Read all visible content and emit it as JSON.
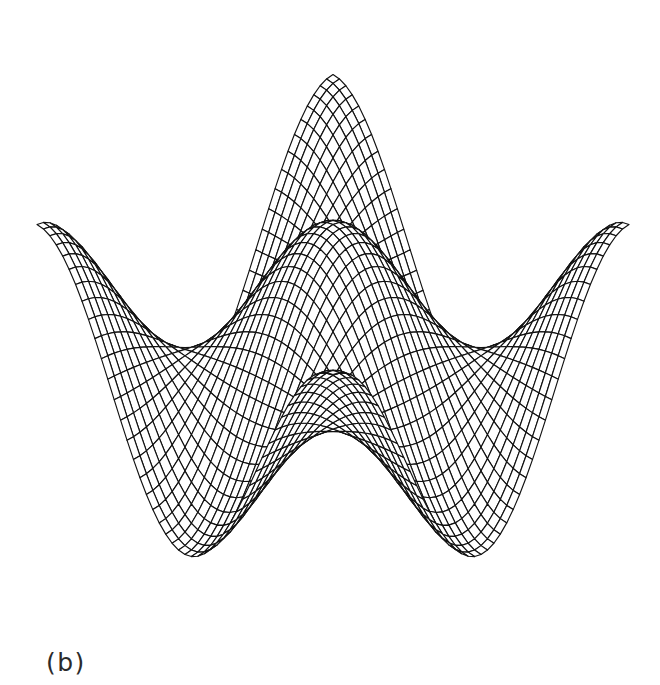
{
  "figure": {
    "caption": "(b)",
    "background_color": "#ffffff",
    "ink_color": "#111111",
    "width": 660,
    "height": 685
  },
  "chart_data": {
    "type": "surface",
    "render_style": "wireframe-mesh-hidden-line",
    "title": "",
    "subtitle": "",
    "xlabel": "",
    "ylabel": "",
    "zlabel": "",
    "grid": false,
    "axes_visible": false,
    "legend": null,
    "legend_position": "none",
    "annotations": [
      {
        "text": "(b)",
        "x": 46,
        "y": 648,
        "role": "figure-part-label"
      }
    ],
    "function": "z = cos(pi*x) * cos(pi*y)",
    "domain": {
      "x": [
        -1.0,
        1.0
      ],
      "y": [
        -1.0,
        1.0
      ]
    },
    "zlim": [
      -1.0,
      1.0
    ],
    "mesh": {
      "nx": 46,
      "ny": 46,
      "cell_style": "diamond"
    },
    "projection": {
      "type": "oblique-elevated",
      "azimuth_deg": 45,
      "elevation_deg": 26,
      "center_x": 333,
      "center_y": 352,
      "scale_x": 296,
      "scale_y": 150,
      "scale_z": 255
    },
    "peaks": [
      {
        "name": "front-center-peak",
        "x": 333,
        "y": 183,
        "height_rank": 2,
        "apex_value": 1.0
      },
      {
        "name": "rear-center-peak",
        "x": 333,
        "y": 30,
        "height_rank": 1,
        "apex_value": 1.0
      },
      {
        "name": "rear-left-peak",
        "x": 200,
        "y": 90,
        "height_rank": 3,
        "apex_value": 1.0
      },
      {
        "name": "rear-right-peak",
        "x": 465,
        "y": 95,
        "height_rank": 3,
        "apex_value": 1.0
      }
    ],
    "corners": [
      {
        "name": "front-corner",
        "x": 297,
        "y": 612
      },
      {
        "name": "left-corner",
        "x": 37,
        "y": 450
      },
      {
        "name": "right-corner",
        "x": 630,
        "y": 480
      },
      {
        "name": "back-corner",
        "x": 333,
        "y": 30
      }
    ]
  }
}
